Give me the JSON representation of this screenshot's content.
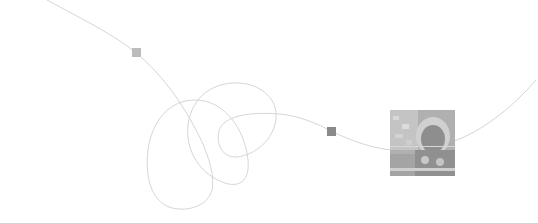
{
  "scene": {
    "description": "Thin gray looping line with two square markers and a grayscale photo thumbnail",
    "background": "#ffffff",
    "line_color": "#d4d4d4",
    "markers": [
      {
        "name": "marker-light",
        "x": 132,
        "y": 48,
        "size": 9,
        "color": "#bcbcbc"
      },
      {
        "name": "marker-dark",
        "x": 327,
        "y": 127,
        "size": 9,
        "color": "#8a8a8a"
      }
    ],
    "photo": {
      "x": 390,
      "y": 110,
      "width": 65,
      "height": 66,
      "subject": "grayscale photo of a child in a fur-trimmed hood and patterned sweater"
    }
  }
}
